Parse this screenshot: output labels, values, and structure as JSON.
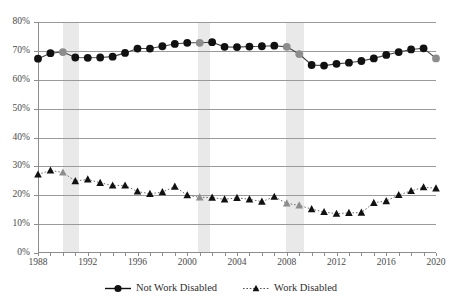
{
  "chart_data": {
    "type": "line",
    "title": "",
    "subtitle": "",
    "xlabel": "",
    "ylabel": "",
    "xlim": [
      1988,
      2020
    ],
    "ylim": [
      0,
      80
    ],
    "y_tick_labels": [
      "0%",
      "10%",
      "20%",
      "30%",
      "40%",
      "50%",
      "60%",
      "70%",
      "80%"
    ],
    "y_tick_values": [
      0,
      10,
      20,
      30,
      40,
      50,
      60,
      70,
      80
    ],
    "x_tick_labels": [
      "1988",
      "1992",
      "1996",
      "2000",
      "2004",
      "2008",
      "2012",
      "2016",
      "2020"
    ],
    "x_tick_values": [
      1988,
      1992,
      1996,
      2000,
      2004,
      2008,
      2012,
      2016,
      2020
    ],
    "x_minor_ticks_every": 1,
    "grid": "horizontal",
    "legend_position": "bottom-center",
    "x": [
      1988,
      1989,
      1990,
      1991,
      1992,
      1993,
      1994,
      1995,
      1996,
      1997,
      1998,
      1999,
      2000,
      2001,
      2002,
      2003,
      2004,
      2005,
      2006,
      2007,
      2008,
      2009,
      2010,
      2011,
      2012,
      2013,
      2014,
      2015,
      2016,
      2017,
      2018,
      2019,
      2020
    ],
    "series": [
      {
        "name": "Not Work Disabled",
        "marker": "circle",
        "line_style": "solid",
        "color": "#111111",
        "highlight_color": "#8d8d8d",
        "values": [
          67.3,
          69.2,
          69.6,
          67.7,
          67.6,
          67.7,
          68.0,
          69.3,
          70.8,
          70.8,
          71.6,
          72.4,
          72.8,
          72.8,
          73.0,
          71.4,
          71.3,
          71.5,
          71.6,
          71.8,
          71.4,
          68.9,
          65.1,
          64.9,
          65.5,
          65.9,
          66.5,
          67.4,
          68.6,
          69.6,
          70.5,
          70.9,
          67.4
        ],
        "highlight_years": [
          1990,
          2001,
          2008,
          2009,
          2020
        ]
      },
      {
        "name": "Work Disabled",
        "marker": "triangle",
        "line_style": "dotted",
        "color": "#111111",
        "highlight_color": "#8d8d8d",
        "values": [
          27.2,
          28.6,
          27.9,
          24.9,
          25.5,
          24.3,
          23.4,
          23.4,
          21.3,
          20.5,
          21.1,
          23.0,
          20.0,
          19.3,
          19.2,
          18.6,
          19.1,
          18.6,
          17.8,
          19.5,
          17.2,
          16.5,
          15.2,
          14.2,
          13.6,
          13.9,
          14.0,
          17.4,
          18.0,
          20.1,
          21.5,
          22.8,
          22.4
        ],
        "highlight_years": [
          1990,
          2001,
          2008,
          2009
        ]
      }
    ],
    "recession_bands": [
      {
        "label": "1990-1991 recession",
        "start": 1990.0,
        "end": 1991.3
      },
      {
        "label": "2001 recession",
        "start": 2000.9,
        "end": 2001.8
      },
      {
        "label": "2008-2009 recession",
        "start": 2007.9,
        "end": 2009.4
      }
    ],
    "band_color": "#e9e9e9"
  },
  "legend": {
    "items": [
      {
        "label": "Not Work Disabled",
        "marker": "circle",
        "line_style": "solid"
      },
      {
        "label": "Work Disabled",
        "marker": "triangle",
        "line_style": "dotted"
      }
    ]
  }
}
